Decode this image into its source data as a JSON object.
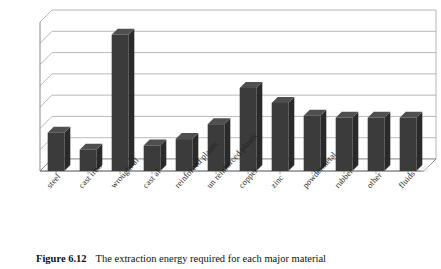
{
  "figure": {
    "caption_number": "Figure 6.12",
    "caption_text": "The extraction energy required for each major material"
  },
  "chart_data": {
    "type": "bar",
    "title": "",
    "xlabel": "",
    "ylabel": "",
    "ylim": [
      0,
      70
    ],
    "grid": true,
    "legend": "none",
    "style": "3d-column",
    "bar_color": "#3b3b3b",
    "bar_side_color": "#2a2a2a",
    "bar_top_color": "#4f4f4f",
    "gridline_color": "#9a9a9a",
    "axis_color": "#7a7a7a",
    "yticks": [
      0,
      10,
      20,
      30,
      40,
      50,
      60,
      70
    ],
    "ytick_labels": [
      "0",
      "10",
      "20",
      "30",
      "40",
      "50",
      "60",
      "70"
    ],
    "categories": [
      "steel",
      "cast iron",
      "wrought al",
      "cast al",
      "reinforced plastic",
      "un reinforced plastic",
      "copper",
      "zinc",
      "powdermetal",
      "rubber",
      "other",
      "fluids"
    ],
    "values": [
      18,
      10,
      64,
      12,
      15,
      22,
      39,
      32,
      26,
      25,
      25,
      25
    ]
  }
}
